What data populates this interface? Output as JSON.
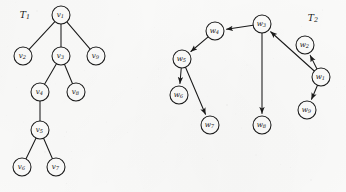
{
  "figure": {
    "width": 346,
    "height": 192,
    "background_color": "#fbfbfa",
    "ink_color": "#1a1a1a",
    "node_fill_color": "#fcfcfb"
  },
  "graphs": [
    {
      "id": "T1",
      "title": "T",
      "title_sub": "1",
      "title_x": 25,
      "title_y": 15,
      "directed": false,
      "node_radius": 9,
      "nodes": [
        {
          "id": "v1",
          "base": "v",
          "sub": "1",
          "x": 61,
          "y": 15
        },
        {
          "id": "v2",
          "base": "v",
          "sub": "2",
          "x": 23,
          "y": 56
        },
        {
          "id": "v3",
          "base": "v",
          "sub": "3",
          "x": 61,
          "y": 56
        },
        {
          "id": "v9",
          "base": "v",
          "sub": "9",
          "x": 96,
          "y": 56
        },
        {
          "id": "v4",
          "base": "v",
          "sub": "4",
          "x": 40,
          "y": 92
        },
        {
          "id": "v8",
          "base": "v",
          "sub": "8",
          "x": 76,
          "y": 92
        },
        {
          "id": "v5",
          "base": "v",
          "sub": "5",
          "x": 40,
          "y": 130
        },
        {
          "id": "v6",
          "base": "v",
          "sub": "6",
          "x": 22,
          "y": 167
        },
        {
          "id": "v7",
          "base": "v",
          "sub": "7",
          "x": 56,
          "y": 167
        }
      ],
      "edges": [
        {
          "from": "v1",
          "to": "v2"
        },
        {
          "from": "v1",
          "to": "v3"
        },
        {
          "from": "v1",
          "to": "v9"
        },
        {
          "from": "v3",
          "to": "v4"
        },
        {
          "from": "v3",
          "to": "v8"
        },
        {
          "from": "v4",
          "to": "v5"
        },
        {
          "from": "v5",
          "to": "v6"
        },
        {
          "from": "v5",
          "to": "v7"
        }
      ]
    },
    {
      "id": "T2",
      "title": "T",
      "title_sub": "2",
      "title_x": 313,
      "title_y": 18,
      "directed": true,
      "node_radius": 9,
      "nodes": [
        {
          "id": "w3",
          "base": "w",
          "sub": "3",
          "x": 262,
          "y": 24
        },
        {
          "id": "w4",
          "base": "w",
          "sub": "4",
          "x": 215,
          "y": 31
        },
        {
          "id": "w5",
          "base": "w",
          "sub": "5",
          "x": 182,
          "y": 59
        },
        {
          "id": "w6",
          "base": "w",
          "sub": "6",
          "x": 179,
          "y": 95
        },
        {
          "id": "w7",
          "base": "w",
          "sub": "7",
          "x": 210,
          "y": 125
        },
        {
          "id": "w8",
          "base": "w",
          "sub": "8",
          "x": 262,
          "y": 125
        },
        {
          "id": "w2",
          "base": "w",
          "sub": "2",
          "x": 305,
          "y": 45
        },
        {
          "id": "w1",
          "base": "w",
          "sub": "1",
          "x": 321,
          "y": 77
        },
        {
          "id": "w9",
          "base": "w",
          "sub": "9",
          "x": 307,
          "y": 110
        }
      ],
      "edges": [
        {
          "from": "w3",
          "to": "w4"
        },
        {
          "from": "w4",
          "to": "w5"
        },
        {
          "from": "w5",
          "to": "w6"
        },
        {
          "from": "w5",
          "to": "w7"
        },
        {
          "from": "w3",
          "to": "w8"
        },
        {
          "from": "w1",
          "to": "w3"
        },
        {
          "from": "w1",
          "to": "w2"
        },
        {
          "from": "w1",
          "to": "w9"
        }
      ]
    }
  ]
}
